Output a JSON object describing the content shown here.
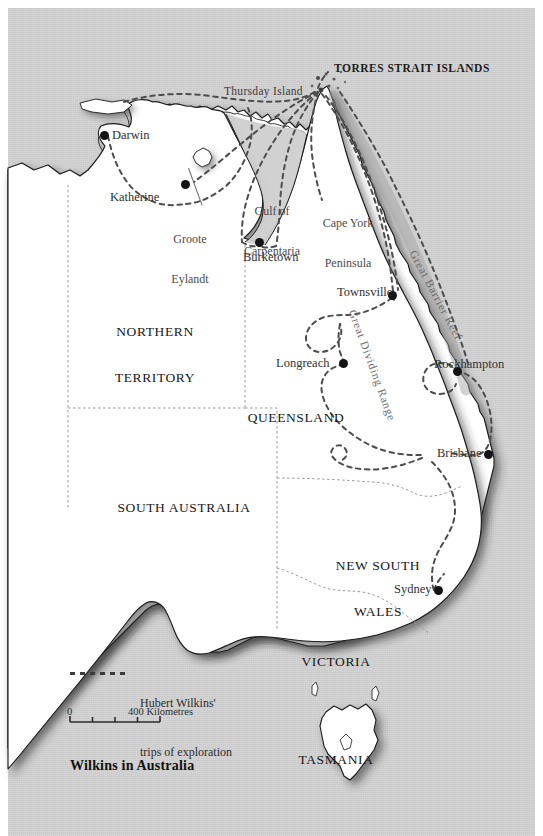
{
  "title": "Wilkins in Australia",
  "colors": {
    "ocean": "#d2d2d2",
    "land": "#ffffff",
    "coast": "#1a1a1a",
    "border": "#9a9a9a",
    "route": "#555555",
    "text": "#2a2a2a"
  },
  "states": [
    {
      "name": "northern-territory",
      "lines": [
        "NORTHERN",
        "TERRITORY"
      ]
    },
    {
      "name": "queensland",
      "lines": [
        "QUEENSLAND"
      ]
    },
    {
      "name": "south-australia",
      "lines": [
        "SOUTH AUSTRALIA"
      ]
    },
    {
      "name": "new-south-wales",
      "lines": [
        "NEW SOUTH",
        "WALES"
      ]
    },
    {
      "name": "victoria",
      "lines": [
        "VICTORIA"
      ]
    },
    {
      "name": "tasmania",
      "lines": [
        "TASMANIA"
      ]
    }
  ],
  "regions": [
    {
      "name": "gulf-of-carpentaria",
      "lines": [
        "Gulf of",
        "Carpentaria"
      ]
    },
    {
      "name": "cape-york-peninsula",
      "lines": [
        "Cape York",
        "Peninsula"
      ]
    },
    {
      "name": "groote-eylandt",
      "lines": [
        "Groote",
        "Eylandt"
      ]
    }
  ],
  "cities": [
    {
      "name": "darwin",
      "label": "Darwin"
    },
    {
      "name": "katherine",
      "label": "Katherine"
    },
    {
      "name": "burketown",
      "label": "Burketown"
    },
    {
      "name": "townsville",
      "label": "Townsville"
    },
    {
      "name": "longreach",
      "label": "Longreach"
    },
    {
      "name": "rockhampton",
      "label": "Rockhampton"
    },
    {
      "name": "brisbane",
      "label": "Brisbane"
    },
    {
      "name": "sydney",
      "label": "Sydney"
    }
  ],
  "islands": [
    {
      "name": "thursday-island",
      "label": "Thursday Island"
    },
    {
      "name": "torres-strait-islands",
      "label": "TORRES STRAIT ISLANDS"
    }
  ],
  "features": [
    {
      "name": "great-barrier-reef",
      "label": "Great Barrier Reef"
    },
    {
      "name": "great-dividing-range",
      "label": "Great Dividing Range"
    }
  ],
  "legend": {
    "line1": "Hubert Wilkins'",
    "line2": "trips of exploration"
  },
  "scale": {
    "start": "0",
    "end": "400 Kilometres",
    "segments": 4
  }
}
